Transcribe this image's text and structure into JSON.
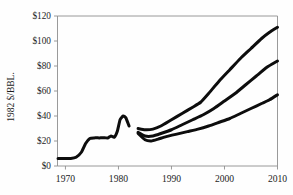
{
  "chart_data": {
    "type": "line",
    "title": "",
    "xlabel": "",
    "ylabel": "1982 $/BBL.",
    "xlim": [
      1968.5,
      2010
    ],
    "ylim": [
      0,
      120
    ],
    "grid": false,
    "legend": "none",
    "y_tick_labels": [
      "$0",
      "$20",
      "$40",
      "$60",
      "$80",
      "$100",
      "$120"
    ],
    "y_tick_values": [
      0,
      20,
      40,
      60,
      80,
      100,
      120
    ],
    "x_tick_labels": [
      "1970",
      "1980",
      "1990",
      "2000",
      "2010"
    ],
    "x_tick_values": [
      1970,
      1980,
      1990,
      2000,
      2010
    ],
    "series": [
      {
        "name": "historical",
        "x": [
          1968.6,
          1970,
          1971,
          1972,
          1973,
          1973.8,
          1974.6,
          1975.4,
          1976.4,
          1977.4,
          1978,
          1978.6,
          1979.2,
          1979.8,
          1980.3,
          1980.9,
          1981.4,
          1982.0
        ],
        "values": [
          6,
          6,
          6,
          7,
          11,
          18,
          22,
          22.5,
          22.5,
          22.6,
          22.4,
          24,
          23,
          28,
          37,
          40,
          38.5,
          32
        ]
      },
      {
        "name": "high-projection",
        "x": [
          1983.7,
          1985,
          1986.5,
          1988,
          1990,
          1992,
          1994,
          1995.5,
          1997,
          1999,
          2001,
          2003,
          2005,
          2007,
          2008.5,
          2010
        ],
        "values": [
          30,
          29,
          29.5,
          32,
          37,
          42,
          47,
          51,
          58,
          68,
          77,
          86,
          94,
          102,
          107,
          111
        ]
      },
      {
        "name": "mid-projection",
        "x": [
          1983.7,
          1985,
          1986.5,
          1988,
          1990,
          1992,
          1994,
          1996,
          1998,
          2000,
          2002,
          2004,
          2006,
          2008,
          2010
        ],
        "values": [
          27,
          24,
          24,
          26,
          29,
          33,
          37,
          41,
          46,
          52,
          58,
          65,
          72,
          79,
          84
        ]
      },
      {
        "name": "low-projection",
        "x": [
          1983.7,
          1985,
          1986.2,
          1987.5,
          1989,
          1991,
          1993,
          1995,
          1997,
          1999,
          2001,
          2003,
          2005,
          2007,
          2008.5,
          2010
        ],
        "values": [
          26,
          21,
          20,
          21.5,
          23.5,
          25.5,
          27.5,
          29.5,
          32,
          35,
          38,
          42,
          46,
          50,
          53,
          57
        ]
      }
    ]
  }
}
